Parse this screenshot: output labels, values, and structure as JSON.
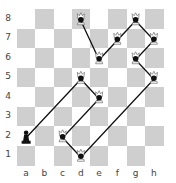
{
  "board": {
    "files": [
      "a",
      "b",
      "c",
      "d",
      "e",
      "f",
      "g",
      "h"
    ],
    "ranks": [
      "8",
      "7",
      "6",
      "5",
      "4",
      "3",
      "2",
      "1"
    ],
    "light_color": "#ffffff",
    "dark_color": "#cfcfcf"
  },
  "pieces": [
    {
      "square": "a2",
      "type": "pawn",
      "color": "black"
    }
  ],
  "markers": [
    {
      "square": "d8",
      "icon": "queen"
    },
    {
      "square": "e6",
      "icon": "queen"
    },
    {
      "square": "f7",
      "icon": "queen"
    },
    {
      "square": "g8",
      "icon": "queen"
    },
    {
      "square": "h7",
      "icon": "queen"
    },
    {
      "square": "g6",
      "icon": "queen"
    },
    {
      "square": "h5",
      "icon": "queen"
    },
    {
      "square": "d1",
      "icon": "king"
    },
    {
      "square": "c2",
      "icon": "queen"
    },
    {
      "square": "e4",
      "icon": "queen"
    },
    {
      "square": "d5",
      "icon": "queen"
    }
  ],
  "path": [
    "d8",
    "e6",
    "f7",
    "g8",
    "h7",
    "g6",
    "h5",
    "d1",
    "c2",
    "e4",
    "d5",
    "a2"
  ],
  "path_color": "#111111"
}
